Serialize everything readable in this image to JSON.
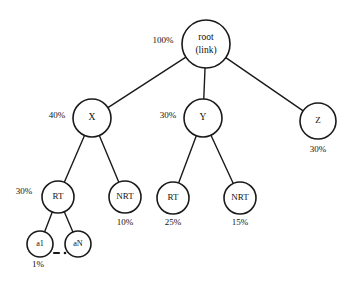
{
  "diagram": {
    "type": "tree",
    "stroke_color": "#1a1a1a",
    "node_fill": "#ffffff",
    "background": "#ffffff",
    "nodes": [
      {
        "id": "root",
        "label_line1": "root",
        "label_line2": "(link)",
        "cx": 206,
        "cy": 44,
        "r": 24,
        "pct": "100%",
        "pct_x": 163,
        "pct_y": 41,
        "pct_pos": "left"
      },
      {
        "id": "x",
        "label_line1": "X",
        "label_line2": "",
        "cx": 92,
        "cy": 118,
        "r": 19,
        "pct": "40%",
        "pct_x": 57,
        "pct_y": 116,
        "pct_pos": "left"
      },
      {
        "id": "y",
        "label_line1": "Y",
        "label_line2": "",
        "cx": 203,
        "cy": 118,
        "r": 19,
        "pct": "30%",
        "pct_x": 168,
        "pct_y": 116,
        "pct_pos": "left"
      },
      {
        "id": "z",
        "label_line1": "Z",
        "label_line2": "",
        "cx": 318,
        "cy": 121,
        "r": 18,
        "pct": "30%",
        "pct_x": 318,
        "pct_y": 150,
        "pct_pos": "below"
      },
      {
        "id": "rt-x",
        "label_line1": "RT",
        "label_line2": "",
        "cx": 58,
        "cy": 197,
        "r": 16,
        "pct": "30%",
        "pct_x": 24,
        "pct_y": 192,
        "pct_pos": "left"
      },
      {
        "id": "nrt-x",
        "label_line1": "NRT",
        "label_line2": "",
        "cx": 125,
        "cy": 197,
        "r": 16,
        "pct": "10%",
        "pct_x": 125,
        "pct_y": 223,
        "pct_pos": "below"
      },
      {
        "id": "rt-y",
        "label_line1": "RT",
        "label_line2": "",
        "cx": 173,
        "cy": 198,
        "r": 16,
        "pct": "25%",
        "pct_x": 173,
        "pct_y": 223,
        "pct_pos": "below"
      },
      {
        "id": "nrt-y",
        "label_line1": "NRT",
        "label_line2": "",
        "cx": 240,
        "cy": 198,
        "r": 16,
        "pct": "15%",
        "pct_x": 240,
        "pct_y": 223,
        "pct_pos": "below"
      },
      {
        "id": "a1",
        "label_line1": "a1",
        "label_line2": "",
        "cx": 40,
        "cy": 244,
        "r": 13,
        "pct": "1%",
        "pct_x": 38,
        "pct_y": 265,
        "pct_pos": "below"
      },
      {
        "id": "aN",
        "label_line1": "aN",
        "label_line2": "",
        "cx": 78,
        "cy": 244,
        "r": 13,
        "pct": "",
        "pct_x": 0,
        "pct_y": 0,
        "pct_pos": "none"
      }
    ],
    "edges": [
      {
        "from": "root",
        "to": "x"
      },
      {
        "from": "root",
        "to": "y"
      },
      {
        "from": "root",
        "to": "z"
      },
      {
        "from": "x",
        "to": "rt-x"
      },
      {
        "from": "x",
        "to": "nrt-x"
      },
      {
        "from": "y",
        "to": "rt-y"
      },
      {
        "from": "y",
        "to": "nrt-y"
      },
      {
        "from": "rt-x",
        "to": "a1"
      },
      {
        "from": "rt-x",
        "to": "aN"
      }
    ],
    "ellipsis": {
      "label": "dash-dot-ellipsis",
      "x1": 54,
      "x2": 65,
      "y": 253
    }
  }
}
